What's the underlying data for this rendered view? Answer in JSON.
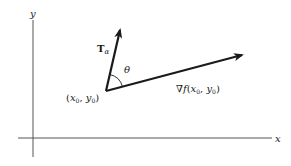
{
  "diagram": {
    "axes": {
      "x_label": "x",
      "y_label": "y",
      "color": "#555555"
    },
    "point": {
      "label": "(x₀, y₀)",
      "label_parts": {
        "open": "(",
        "x": "x",
        "x_sub": "0",
        "sep": ", ",
        "y": "y",
        "y_sub": "0",
        "close": ")"
      }
    },
    "vectors": [
      {
        "name": "tangent",
        "label_main": "T",
        "label_sub": "α",
        "color": "#1a1a1a"
      },
      {
        "name": "gradient",
        "label_nabla": "∇",
        "label_f": "f",
        "label_args_open": "(",
        "label_x": "x",
        "label_x_sub": "0",
        "label_sep": ", ",
        "label_y": "y",
        "label_y_sub": "0",
        "label_args_close": ")",
        "color": "#1a1a1a"
      }
    ],
    "angle": {
      "label": "θ"
    }
  }
}
